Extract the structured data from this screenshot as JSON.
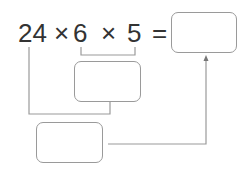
{
  "expression": {
    "term1": "24",
    "op1": "×",
    "term2": "6",
    "op2": "×",
    "term3": "5",
    "equals": "="
  },
  "boxes": {
    "answer": "",
    "product_6_5": "",
    "final_product": ""
  },
  "colors": {
    "text": "#333333",
    "lines": "#9a9a9a"
  }
}
